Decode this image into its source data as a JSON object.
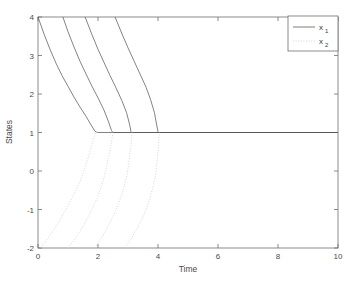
{
  "chart_data": {
    "type": "line",
    "title": "",
    "xlabel": "Time",
    "ylabel": "States",
    "xlim": [
      0,
      10
    ],
    "ylim": [
      -2,
      4
    ],
    "xticks": [
      0,
      2,
      4,
      6,
      8,
      10
    ],
    "yticks": [
      -2,
      -1,
      0,
      1,
      2,
      3,
      4
    ],
    "xtick_labels": [
      "0",
      "2",
      "4",
      "6",
      "8",
      "10"
    ],
    "ytick_labels": [
      "-2",
      "-1",
      "0",
      "1",
      "2",
      "3",
      "4"
    ],
    "grid": false,
    "legend_position": "upper-right",
    "legend": [
      {
        "base": "x",
        "sub": "1",
        "style": "solid"
      },
      {
        "base": "x",
        "sub": "2",
        "style": "dotted"
      }
    ],
    "series": [
      {
        "name": "x1",
        "style": "solid",
        "points": [
          [
            0.0,
            4.0
          ],
          [
            0.2,
            3.56
          ],
          [
            0.4,
            3.16
          ],
          [
            0.6,
            2.8
          ],
          [
            0.8,
            2.48
          ],
          [
            1.0,
            2.2
          ],
          [
            1.2,
            1.92
          ],
          [
            1.4,
            1.66
          ],
          [
            1.6,
            1.42
          ],
          [
            1.75,
            1.22
          ],
          [
            1.9,
            1.03
          ],
          [
            1.98,
            1.0
          ],
          [
            10.0,
            1.0
          ]
        ]
      },
      {
        "name": "x1",
        "style": "solid",
        "points": [
          [
            0.83,
            4.0
          ],
          [
            1.0,
            3.62
          ],
          [
            1.2,
            3.22
          ],
          [
            1.4,
            2.85
          ],
          [
            1.6,
            2.52
          ],
          [
            1.8,
            2.2
          ],
          [
            2.0,
            1.9
          ],
          [
            2.2,
            1.58
          ],
          [
            2.35,
            1.28
          ],
          [
            2.45,
            1.05
          ],
          [
            2.5,
            1.0
          ],
          [
            10.0,
            1.0
          ]
        ]
      },
      {
        "name": "x1",
        "style": "solid",
        "points": [
          [
            1.57,
            4.0
          ],
          [
            1.8,
            3.54
          ],
          [
            2.0,
            3.16
          ],
          [
            2.2,
            2.82
          ],
          [
            2.4,
            2.48
          ],
          [
            2.6,
            2.16
          ],
          [
            2.8,
            1.82
          ],
          [
            2.95,
            1.52
          ],
          [
            3.05,
            1.22
          ],
          [
            3.1,
            1.02
          ],
          [
            3.12,
            1.0
          ],
          [
            10.0,
            1.0
          ]
        ]
      },
      {
        "name": "x1",
        "style": "solid",
        "points": [
          [
            2.57,
            4.0
          ],
          [
            2.8,
            3.56
          ],
          [
            3.0,
            3.2
          ],
          [
            3.2,
            2.86
          ],
          [
            3.4,
            2.52
          ],
          [
            3.6,
            2.18
          ],
          [
            3.75,
            1.86
          ],
          [
            3.88,
            1.52
          ],
          [
            3.95,
            1.22
          ],
          [
            4.0,
            1.02
          ],
          [
            4.02,
            1.0
          ],
          [
            10.0,
            1.0
          ]
        ]
      },
      {
        "name": "x2",
        "style": "dotted",
        "points": [
          [
            0.08,
            -2.0
          ],
          [
            0.3,
            -1.78
          ],
          [
            0.55,
            -1.5
          ],
          [
            0.8,
            -1.18
          ],
          [
            1.0,
            -0.9
          ],
          [
            1.2,
            -0.6
          ],
          [
            1.4,
            -0.28
          ],
          [
            1.55,
            0.05
          ],
          [
            1.7,
            0.42
          ],
          [
            1.82,
            0.75
          ],
          [
            1.92,
            1.0
          ],
          [
            1.98,
            1.0
          ]
        ]
      },
      {
        "name": "x2",
        "style": "dotted",
        "points": [
          [
            1.0,
            -2.0
          ],
          [
            1.25,
            -1.74
          ],
          [
            1.5,
            -1.44
          ],
          [
            1.72,
            -1.12
          ],
          [
            1.92,
            -0.8
          ],
          [
            2.08,
            -0.48
          ],
          [
            2.22,
            -0.12
          ],
          [
            2.32,
            0.25
          ],
          [
            2.42,
            0.62
          ],
          [
            2.48,
            0.9
          ],
          [
            2.5,
            1.0
          ]
        ]
      },
      {
        "name": "x2",
        "style": "dotted",
        "points": [
          [
            1.9,
            -2.0
          ],
          [
            2.1,
            -1.76
          ],
          [
            2.32,
            -1.46
          ],
          [
            2.52,
            -1.14
          ],
          [
            2.7,
            -0.82
          ],
          [
            2.85,
            -0.48
          ],
          [
            2.96,
            -0.12
          ],
          [
            3.04,
            0.28
          ],
          [
            3.1,
            0.66
          ],
          [
            3.12,
            0.92
          ],
          [
            3.13,
            1.0
          ]
        ]
      },
      {
        "name": "x2",
        "style": "dotted",
        "points": [
          [
            2.9,
            -2.0
          ],
          [
            3.12,
            -1.74
          ],
          [
            3.34,
            -1.44
          ],
          [
            3.54,
            -1.12
          ],
          [
            3.7,
            -0.8
          ],
          [
            3.82,
            -0.46
          ],
          [
            3.92,
            -0.08
          ],
          [
            3.98,
            0.32
          ],
          [
            4.02,
            0.7
          ],
          [
            4.04,
            0.94
          ],
          [
            4.05,
            1.0
          ]
        ]
      }
    ]
  },
  "axes": {
    "x_label": "Time",
    "y_label": "States"
  }
}
